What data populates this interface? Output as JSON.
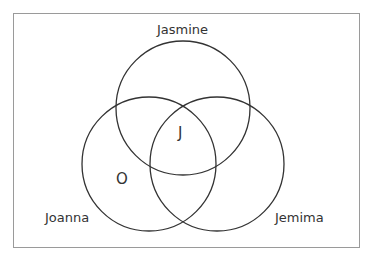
{
  "diagram": {
    "type": "venn",
    "sets": [
      {
        "name": "Jasmine",
        "cx": 183,
        "cy": 108,
        "r": 67
      },
      {
        "name": "Joanna",
        "cx": 149,
        "cy": 164,
        "r": 67
      },
      {
        "name": "Jemima",
        "cx": 217,
        "cy": 164,
        "r": 67
      }
    ],
    "labels": {
      "jasmine": "Jasmine",
      "joanna": "Joanna",
      "jemima": "Jemima"
    },
    "markers": {
      "center": "J",
      "joanna_only": "O"
    },
    "colors": {
      "stroke": "#333333",
      "border": "#9a9a9a"
    }
  }
}
